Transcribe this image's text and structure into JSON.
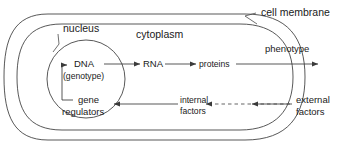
{
  "diagram": {
    "background_color": "#ffffff",
    "line_color": "#3a3a3a",
    "text_color": "#1a1a1a",
    "labels": {
      "cell_membrane": "cell membrane",
      "cytoplasm": "cytoplasm",
      "nucleus": "nucleus",
      "dna": "DNA",
      "genotype": "(genotype)",
      "gene": "gene",
      "regulators": "regulators",
      "rna": "RNA",
      "proteins": "proteins",
      "phenotype": "phenotype",
      "internal": "internal",
      "internal_factors": "factors",
      "external": "external",
      "external_factors": "factors"
    },
    "flow": [
      {
        "from": "gene regulators",
        "to": "DNA",
        "style": "solid",
        "direction": "up"
      },
      {
        "from": "DNA",
        "to": "RNA",
        "style": "solid",
        "direction": "right"
      },
      {
        "from": "RNA",
        "to": "proteins",
        "style": "solid",
        "direction": "right"
      },
      {
        "from": "proteins",
        "to": "phenotype",
        "style": "solid",
        "direction": "right"
      },
      {
        "from": "external factors",
        "to": "internal factors",
        "style": "dashed",
        "direction": "left"
      },
      {
        "from": "internal factors",
        "to": "gene regulators",
        "style": "solid",
        "direction": "left"
      }
    ],
    "compartments": [
      {
        "name": "cell membrane",
        "shape": "capsule"
      },
      {
        "name": "cytoplasm",
        "shape": "capsule"
      },
      {
        "name": "nucleus",
        "shape": "circle"
      }
    ]
  }
}
